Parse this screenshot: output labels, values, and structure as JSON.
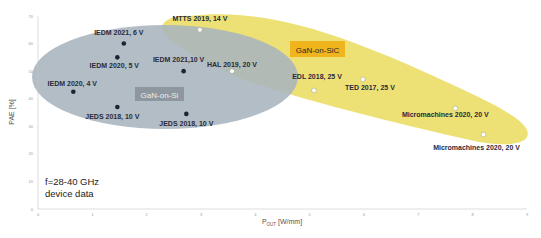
{
  "chart_data": {
    "type": "scatter",
    "title": "",
    "xlabel": "P_OUT [W/mm]",
    "xlabel_main": "P",
    "xlabel_sub": "OUT",
    "xlabel_unit": " [W/mm]",
    "ylabel": "PAE [%]",
    "xlim": [
      0,
      9
    ],
    "ylim": [
      0,
      70
    ],
    "x_ticks": [
      "0",
      "1",
      "2",
      "3",
      "4",
      "5",
      "6",
      "7",
      "8",
      "9"
    ],
    "y_ticks": [
      "0",
      "10",
      "20",
      "30",
      "40",
      "50",
      "60",
      "70"
    ],
    "grid": false,
    "annotation": [
      "f=28-40 GHz",
      "device data"
    ],
    "series": [
      {
        "name": "GaN-on-Si",
        "marker": "filled-dark-circle",
        "region_color": "#a9b4bd",
        "label_bg": "#8f979e",
        "points": [
          {
            "label": "IEDM 2021, 6 V",
            "x": 1.58,
            "y": 60
          },
          {
            "label": "IEDM 2020, 5 V",
            "x": 1.46,
            "y": 55
          },
          {
            "label": "IEDM 2020, 4 V",
            "x": 0.65,
            "y": 42.5
          },
          {
            "label": "JEDS 2018, 10 V",
            "x": 1.46,
            "y": 37
          },
          {
            "label": "IEDM 2021,10 V",
            "x": 2.68,
            "y": 50
          },
          {
            "label": "JEDS 2018, 10 V",
            "x": 2.73,
            "y": 34.5
          }
        ]
      },
      {
        "name": "GaN-on-SiC",
        "marker": "hollow-white-circle",
        "region_color": "#ecdf6e",
        "label_bg": "#f0b41c",
        "points": [
          {
            "label": "MTTS 2019, 14 V",
            "x": 2.98,
            "y": 65
          },
          {
            "label": "HAL 2019, 20 V",
            "x": 3.57,
            "y": 50
          },
          {
            "label": "EDL 2018, 25 V",
            "x": 5.08,
            "y": 43
          },
          {
            "label": "TED 2017, 25 V",
            "x": 5.98,
            "y": 47
          },
          {
            "label": "Micromachines 2020, 20 V",
            "x": 7.68,
            "y": 36.5
          },
          {
            "label": "Micromachines 2020, 20 V",
            "x": 8.2,
            "y": 27
          }
        ]
      }
    ]
  }
}
